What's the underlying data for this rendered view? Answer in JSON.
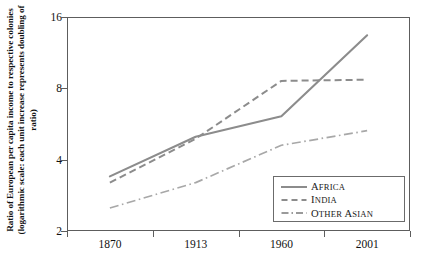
{
  "chart_data": {
    "type": "line",
    "title": "",
    "xlabel": "",
    "ylabel": "Ratio of European per capita income to respective colonies (logarithmic scale: each unit increase represents doubling of ratio)",
    "x_categories": [
      "1870",
      "1913",
      "1960",
      "2001"
    ],
    "y_ticks": [
      2,
      4,
      8,
      16
    ],
    "ylim": [
      2,
      16
    ],
    "y_scale": "log2",
    "grid": false,
    "legend_position": "bottom-right",
    "series": [
      {
        "name": "Africa",
        "style": "solid",
        "color": "#8c8c8c",
        "values": [
          3.4,
          5.0,
          6.1,
          13.4
        ]
      },
      {
        "name": "India",
        "style": "dashed",
        "color": "#8c8c8c",
        "values": [
          3.2,
          4.9,
          8.6,
          8.7
        ]
      },
      {
        "name": "Other Asian",
        "style": "dash-dot",
        "color": "#a8a8a8",
        "values": [
          2.5,
          3.2,
          4.6,
          5.3
        ]
      }
    ]
  },
  "axis": {
    "y_tick_labels": [
      "16",
      "8",
      "4",
      "2"
    ],
    "x_tick_labels": [
      "1870",
      "1913",
      "1960",
      "2001"
    ]
  },
  "legend": {
    "items": [
      {
        "label": "Africa",
        "label_first": "A",
        "label_rest": "FRICA",
        "style": "solid"
      },
      {
        "label": "India",
        "label_first": "I",
        "label_rest": "NDIA",
        "style": "dashed"
      },
      {
        "label": "Other Asian",
        "label_first": "O",
        "label_rest": "THER ",
        "label_first2": "A",
        "label_rest2": "SIAN",
        "style": "dash-dot"
      }
    ]
  }
}
